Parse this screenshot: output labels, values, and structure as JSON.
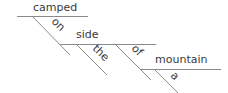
{
  "diagram": {
    "type": "sentence-diagram",
    "words": {
      "verb": "camped",
      "prep1": "on",
      "obj1": "side",
      "det1": "the",
      "prep2": "of",
      "obj2": "mountain",
      "det2": "a"
    },
    "colors": {
      "line": "#8a8a8a",
      "text": "#3a3a3a"
    }
  }
}
